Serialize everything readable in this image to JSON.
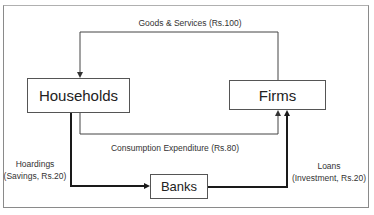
{
  "diagram": {
    "nodes": {
      "households": "Households",
      "firms": "Firms",
      "banks": "Banks"
    },
    "flows": {
      "goods_services": "Goods & Services (Rs.100)",
      "consumption": "Consumption Expenditure (Rs.80)",
      "hoardings_line1": "Hoardings",
      "hoardings_line2": "(Savings, Rs.20)",
      "loans_line1": "Loans",
      "loans_line2": "(Investment, Rs.20)"
    },
    "colors": {
      "line": "#444444",
      "thick_line": "#1a1a1a",
      "border": "#8a8a8a"
    }
  }
}
